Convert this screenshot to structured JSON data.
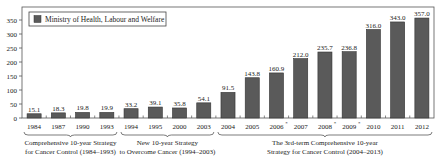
{
  "chart_data": {
    "type": "bar",
    "title": "",
    "xlabel": "",
    "ylabel": "",
    "ylim": [
      0,
      370
    ],
    "yticks": [
      0,
      50,
      100,
      150,
      200,
      250,
      300,
      350
    ],
    "grid": false,
    "legend": {
      "position": "top-left",
      "entries": [
        "Ministry of Health, Labour and Welfare"
      ]
    },
    "categories": [
      "1984",
      "1987",
      "1990",
      "1993",
      "1994",
      "1995",
      "2000",
      "2003",
      "2004",
      "2005",
      "2006",
      "2007",
      "2008",
      "2009",
      "2010",
      "2011",
      "2012"
    ],
    "category_marks": [
      "",
      "",
      "",
      "",
      "",
      "",
      "",
      "",
      "",
      "",
      "*",
      "",
      "*",
      "*",
      "",
      "",
      ""
    ],
    "series": [
      {
        "name": "Ministry of Health, Labour and Welfare",
        "values": [
          15.1,
          18.3,
          19.8,
          19.9,
          33.2,
          39.1,
          35.8,
          54.1,
          91.5,
          143.8,
          160.9,
          212.0,
          235.7,
          236.8,
          316.0,
          343.0,
          357.0
        ],
        "labels": [
          "15.1",
          "18.3",
          "19.8",
          "19.9",
          "33.2",
          "39.1",
          "35.8",
          "54.1",
          "91.5",
          "143.8",
          "160.9",
          "212.0",
          "235.7",
          "236.8",
          "316.0",
          "343.0",
          "357.0"
        ],
        "color": "#5a5a5a"
      }
    ],
    "groups": [
      {
        "label_lines": [
          "Comprehensive 10-year Strategy",
          "for Cancer Control (1984–1993)"
        ],
        "from": 0,
        "to": 3
      },
      {
        "label_lines": [
          "New 10-year Strategy",
          "to Overcome Cancer (1994–2003)"
        ],
        "from": 4,
        "to": 7
      },
      {
        "label_lines": [
          "The 3rd-term Comprehensive 10-year",
          "Strategy for Cancer Control (2004–2013)"
        ],
        "from": 8,
        "to": 16
      }
    ]
  }
}
